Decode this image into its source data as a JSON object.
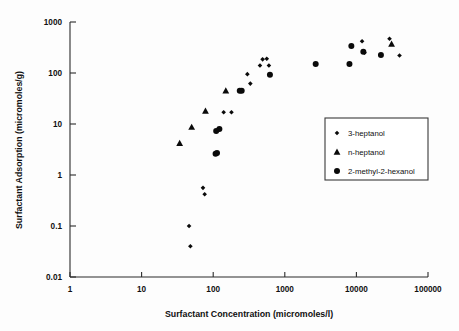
{
  "chart_data": {
    "type": "scatter",
    "title": "",
    "xlabel": "Surfactant Concentration (micromoles/l)",
    "ylabel": "Surfactant Adsorption (micromoles/g)",
    "xscale": "log",
    "yscale": "log",
    "xlim": [
      1,
      100000
    ],
    "ylim": [
      0.01,
      1000
    ],
    "grid": false,
    "legend_position": "center-right",
    "xticks": [
      1,
      10,
      100,
      1000,
      10000,
      100000
    ],
    "xtick_labels": [
      "1",
      "10",
      "100",
      "1000",
      "10000",
      "100000"
    ],
    "yticks": [
      0.01,
      0.1,
      1,
      10,
      100,
      1000
    ],
    "ytick_labels": [
      "0.01",
      "0.1",
      "1",
      "10",
      "100",
      "1000"
    ],
    "series": [
      {
        "name": "3-heptanol",
        "marker": "small-diamond",
        "color": "#0a0a0a",
        "points": [
          {
            "x": 48,
            "y": 0.04
          },
          {
            "x": 46,
            "y": 0.1
          },
          {
            "x": 76,
            "y": 0.42
          },
          {
            "x": 72,
            "y": 0.56
          },
          {
            "x": 140,
            "y": 17
          },
          {
            "x": 180,
            "y": 17
          },
          {
            "x": 330,
            "y": 62
          },
          {
            "x": 300,
            "y": 95
          },
          {
            "x": 450,
            "y": 140
          },
          {
            "x": 600,
            "y": 140
          },
          {
            "x": 490,
            "y": 185
          },
          {
            "x": 560,
            "y": 190
          },
          {
            "x": 12000,
            "y": 420
          },
          {
            "x": 13000,
            "y": 250
          },
          {
            "x": 29000,
            "y": 470
          },
          {
            "x": 40000,
            "y": 220
          }
        ]
      },
      {
        "name": "n-heptanol",
        "marker": "triangle",
        "color": "#0a0a0a",
        "points": [
          {
            "x": 34,
            "y": 4.2
          },
          {
            "x": 50,
            "y": 8.7
          },
          {
            "x": 78,
            "y": 18
          },
          {
            "x": 150,
            "y": 45
          },
          {
            "x": 31000,
            "y": 370
          }
        ]
      },
      {
        "name": "2-methyl-2-hexanol",
        "marker": "circle",
        "color": "#0a0a0a",
        "points": [
          {
            "x": 108,
            "y": 2.6
          },
          {
            "x": 113,
            "y": 2.7
          },
          {
            "x": 110,
            "y": 7.3
          },
          {
            "x": 122,
            "y": 8.0
          },
          {
            "x": 235,
            "y": 45
          },
          {
            "x": 250,
            "y": 45
          },
          {
            "x": 620,
            "y": 92
          },
          {
            "x": 2700,
            "y": 150
          },
          {
            "x": 8000,
            "y": 150
          },
          {
            "x": 8500,
            "y": 340
          },
          {
            "x": 12500,
            "y": 260
          },
          {
            "x": 22000,
            "y": 225
          }
        ]
      }
    ]
  },
  "axes": {
    "x_title": "Surfactant Concentration (micromoles/l)",
    "y_title": "Surfactant Adsorption (micromoles/g)"
  },
  "legend": {
    "entries": [
      {
        "label": "3-heptanol",
        "marker": "small-diamond"
      },
      {
        "label": "n-heptanol",
        "marker": "triangle"
      },
      {
        "label": "2-methyl-2-hexanol",
        "marker": "circle"
      }
    ]
  }
}
